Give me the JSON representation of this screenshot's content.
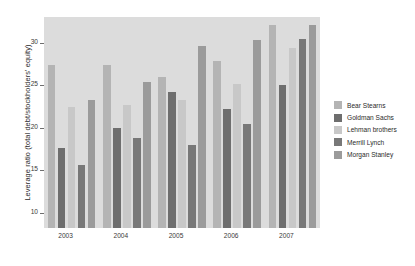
{
  "chart_data": {
    "type": "bar",
    "title": "",
    "xlabel": "",
    "ylabel": "Leverage ratio (total debt/stockholders' equity)",
    "categories": [
      "2003",
      "2004",
      "2005",
      "2006",
      "2007"
    ],
    "yticks": [
      10,
      15,
      20,
      25,
      30
    ],
    "ylim": [
      8.2,
      33.0
    ],
    "grid": false,
    "legend_position": "right",
    "series": [
      {
        "name": "Bear Stearns",
        "color": "#b4b4b4",
        "values": [
          27.4,
          27.4,
          26.0,
          27.8,
          32.1
        ]
      },
      {
        "name": "Goldman Sachs",
        "color": "#6e6e6e",
        "values": [
          17.6,
          20.0,
          24.2,
          22.2,
          25.0
        ]
      },
      {
        "name": "Lehman brothers",
        "color": "#c8c8c8",
        "values": [
          22.4,
          22.6,
          23.2,
          25.1,
          29.3
        ]
      },
      {
        "name": "Merrill Lynch",
        "color": "#787878",
        "values": [
          15.6,
          18.8,
          18.0,
          20.4,
          30.4
        ]
      },
      {
        "name": "Morgan Stanley",
        "color": "#9b9b9b",
        "values": [
          23.2,
          25.4,
          29.6,
          30.3,
          32.1
        ]
      }
    ]
  }
}
